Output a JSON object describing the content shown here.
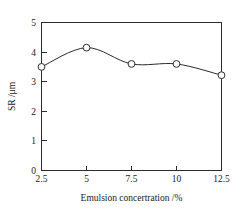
{
  "chart_data": {
    "type": "line",
    "title": "",
    "xlabel": "Emulsion concertration /%",
    "ylabel": "SR /μm",
    "x": [
      2.5,
      5,
      7.5,
      10,
      12.5
    ],
    "values": [
      3.5,
      4.15,
      3.6,
      3.6,
      3.22
    ],
    "series": [
      {
        "name": "SR",
        "values": [
          3.5,
          4.15,
          3.6,
          3.6,
          3.22
        ]
      }
    ],
    "xtick_labels": [
      "2.5",
      "5",
      "7.5",
      "10",
      "12.5"
    ],
    "ytick_labels": [
      "0",
      "1",
      "2",
      "3",
      "4",
      "5"
    ],
    "xlim": [
      2.5,
      12.5
    ],
    "ylim": [
      0,
      5
    ],
    "grid": false,
    "legend": false,
    "marker": "open-circle",
    "line_color": "#2b2b2b",
    "marker_fill": "#ffffff",
    "background": "#ffffff"
  },
  "axes": {
    "x_title": "Emulsion concertration /%",
    "y_title": "SR /μm",
    "x_ticks": [
      {
        "label": "2.5",
        "value": 2.5
      },
      {
        "label": "5",
        "value": 5
      },
      {
        "label": "7.5",
        "value": 7.5
      },
      {
        "label": "10",
        "value": 10
      },
      {
        "label": "12.5",
        "value": 12.5
      }
    ],
    "y_ticks": [
      {
        "label": "0",
        "value": 0
      },
      {
        "label": "1",
        "value": 1
      },
      {
        "label": "2",
        "value": 2
      },
      {
        "label": "3",
        "value": 3
      },
      {
        "label": "4",
        "value": 4
      },
      {
        "label": "5",
        "value": 5
      }
    ]
  }
}
